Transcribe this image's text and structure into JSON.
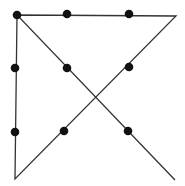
{
  "diagram": {
    "type": "nine-dot-puzzle-solution",
    "background": "#ffffff",
    "line_color": "#333333",
    "dot_color": "#111111",
    "dots": [
      {
        "x": 17,
        "y": 15
      },
      {
        "x": 67,
        "y": 14
      },
      {
        "x": 129,
        "y": 14
      },
      {
        "x": 15,
        "y": 68
      },
      {
        "x": 67,
        "y": 68
      },
      {
        "x": 129,
        "y": 67
      },
      {
        "x": 15,
        "y": 132
      },
      {
        "x": 64,
        "y": 131
      },
      {
        "x": 128,
        "y": 131
      }
    ],
    "path_points": [
      {
        "x": 175,
        "y": 180
      },
      {
        "x": 17,
        "y": 15
      },
      {
        "x": 176,
        "y": 16
      },
      {
        "x": 15,
        "y": 179
      },
      {
        "x": 17,
        "y": 15
      }
    ]
  }
}
